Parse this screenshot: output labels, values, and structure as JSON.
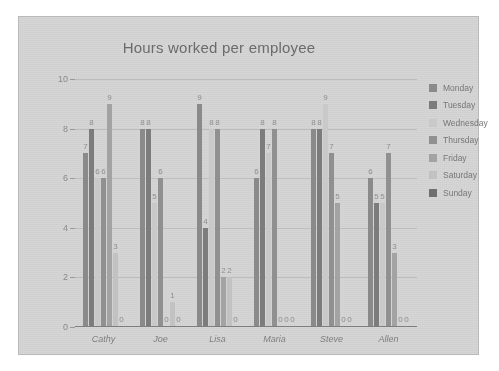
{
  "chart_data": {
    "type": "bar",
    "title": "Hours worked per employee",
    "xlabel": "",
    "ylabel": "",
    "ylim": [
      0,
      10
    ],
    "yticks": [
      "0",
      "2",
      "4",
      "6",
      "8",
      "10"
    ],
    "grid": true,
    "legend_position": "right",
    "categories": [
      "Cathy",
      "Joe",
      "Lisa",
      "Maria",
      "Steve",
      "Allen"
    ],
    "series": [
      {
        "name": "Monday",
        "color": "#8a8a8a",
        "values": [
          7,
          8,
          9,
          6,
          8,
          6
        ]
      },
      {
        "name": "Tuesday",
        "color": "#7c7c7c",
        "values": [
          8,
          8,
          4,
          8,
          8,
          5
        ]
      },
      {
        "name": "Wednesday",
        "color": "#c9c9c9",
        "values": [
          6,
          5,
          8,
          7,
          9,
          5
        ]
      },
      {
        "name": "Thursday",
        "color": "#909090",
        "values": [
          6,
          6,
          8,
          8,
          7,
          7
        ]
      },
      {
        "name": "Friday",
        "color": "#a3a3a3",
        "values": [
          9,
          0,
          2,
          0,
          5,
          3
        ]
      },
      {
        "name": "Saturday",
        "color": "#c2c2c2",
        "values": [
          3,
          1,
          2,
          0,
          0,
          0
        ]
      },
      {
        "name": "Sunday",
        "color": "#6f6f6f",
        "values": [
          0,
          0,
          0,
          0,
          0,
          0
        ]
      }
    ]
  },
  "legend": {
    "items": [
      {
        "label": "Monday"
      },
      {
        "label": "Tuesday"
      },
      {
        "label": "Wednesday"
      },
      {
        "label": "Thursday"
      },
      {
        "label": "Friday"
      },
      {
        "label": "Saturday"
      },
      {
        "label": "Sunday"
      }
    ]
  }
}
